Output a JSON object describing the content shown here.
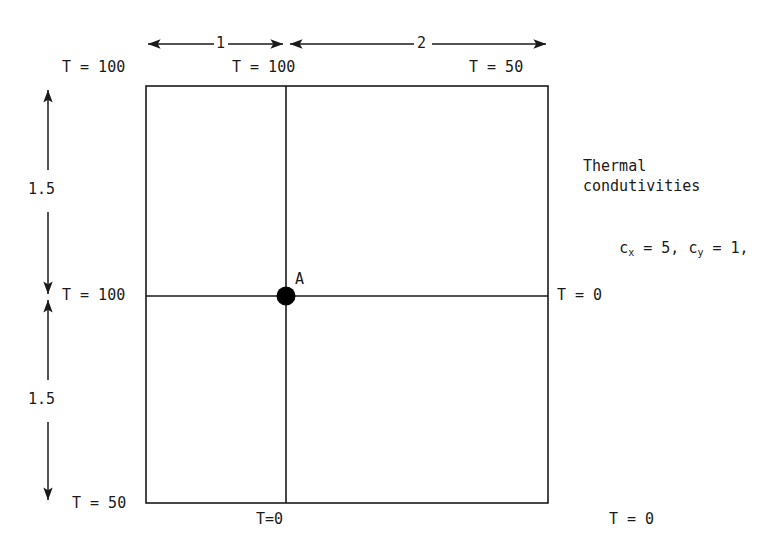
{
  "diagram": {
    "domain_box": {
      "left_px": 146,
      "top_px": 86,
      "right_px": 548,
      "bottom_px": 503,
      "split_x_px": 286,
      "split_y_px": 296
    },
    "dimensions": {
      "top_left_segment": "1",
      "top_right_segment": "2",
      "left_upper_segment": "1.5",
      "left_lower_segment": "1.5"
    },
    "boundary_labels": {
      "top_left": "T = 100",
      "top_center": "T = 100",
      "top_right": "T = 50",
      "left_middle": "T = 100",
      "right_middle": "T = 0",
      "bottom_left": "T = 50",
      "bottom_center": "T=0",
      "bottom_right": "T = 0"
    },
    "point": {
      "label": "A"
    },
    "annotation": {
      "line1": "Thermal",
      "line2": "condutivities",
      "conductivity_prefix": "c",
      "conductivity_x_sub": "x",
      "conductivity_x_value": " = 5, ",
      "conductivity_y_prefix": "c",
      "conductivity_y_sub": "y",
      "conductivity_y_value": " = 1,"
    },
    "colors": {
      "ink": "#1a1a1a",
      "background": "#ffffff",
      "point_fill": "#000000"
    }
  }
}
